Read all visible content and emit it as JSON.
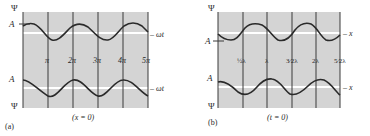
{
  "figure": {
    "colors": {
      "panel_fill": "#d4d4d4",
      "wave": "#2a2a2a",
      "gridline": "#3a3a3a",
      "baseline": "#ffffff",
      "text": "#2a2a2a"
    },
    "panels": [
      {
        "id": "a",
        "panel_label": "(a)",
        "caption": "(x = 0)",
        "y_axis_top_label": "Ψ",
        "y_axis_bottom_label": "Ψ",
        "amplitude_label_top": "A",
        "amplitude_label_bottom": "A",
        "axis_variable_top": "– ωt",
        "axis_variable_bottom": "– ωt",
        "tick_labels": [
          "π",
          "2π",
          "3π",
          "4π",
          "5π"
        ]
      },
      {
        "id": "b",
        "panel_label": "(b)",
        "caption": "(t = 0)",
        "y_axis_top_label": "Ψ",
        "y_axis_bottom_label": "Ψ",
        "amplitude_label_top": "A",
        "amplitude_label_bottom": "A",
        "axis_variable_top": "– x",
        "axis_variable_bottom": "– x",
        "tick_labels": [
          "½λ",
          "λ",
          "3⁄2λ",
          "2λ",
          "5⁄2λ"
        ]
      }
    ]
  }
}
